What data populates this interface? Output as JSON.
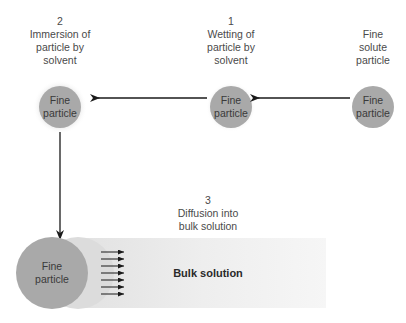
{
  "stages": [
    {
      "id": "stage-2",
      "number": "2",
      "lines": [
        "Immersion of",
        "particle by",
        "solvent"
      ]
    },
    {
      "id": "stage-1",
      "number": "1",
      "lines": [
        "Wetting of",
        "particle by",
        "solvent"
      ]
    },
    {
      "id": "start",
      "number": "",
      "lines": [
        "Fine",
        "solute",
        "particle"
      ]
    },
    {
      "id": "stage-3",
      "number": "3",
      "lines": [
        "Diffusion into",
        "bulk solution"
      ]
    }
  ],
  "particle_label": [
    "Fine",
    "particle"
  ],
  "bulk_label": "Bulk solution",
  "colors": {
    "particle": "#a9a9a9",
    "halo": "#e9e9e9",
    "wetted_shell": "#dcdcdc",
    "bulk_gradient_start": "#e4e4e4",
    "bulk_gradient_end": "#f7f7f7",
    "arrow": "#1a1a1a",
    "text": "#4a4a4a"
  }
}
